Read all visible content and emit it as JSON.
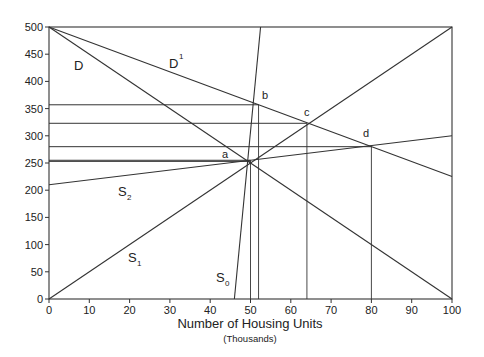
{
  "chart_data": {
    "type": "line",
    "title": "",
    "xlabel": "Number of Housing Units",
    "xlabel_sub": "(Thousands)",
    "ylabel": "",
    "xlim": [
      0,
      100
    ],
    "ylim": [
      0,
      500
    ],
    "x_ticks": [
      0,
      10,
      20,
      30,
      40,
      50,
      60,
      70,
      80,
      90,
      100
    ],
    "y_ticks": [
      0,
      50,
      100,
      150,
      200,
      250,
      300,
      350,
      400,
      450,
      500
    ],
    "grid": false,
    "series": [
      {
        "name": "D",
        "points": [
          [
            0,
            500
          ],
          [
            100,
            0
          ]
        ]
      },
      {
        "name": "D1",
        "points": [
          [
            0,
            500
          ],
          [
            100,
            225
          ]
        ]
      },
      {
        "name": "S0",
        "points": [
          [
            46,
            0
          ],
          [
            52.5,
            500
          ]
        ]
      },
      {
        "name": "S1",
        "points": [
          [
            0,
            0
          ],
          [
            100,
            500
          ]
        ]
      },
      {
        "name": "S2",
        "points": [
          [
            0,
            210
          ],
          [
            100,
            300
          ]
        ]
      }
    ],
    "annotations": [
      {
        "label": "a",
        "x": 50,
        "y": 255
      },
      {
        "label": "b",
        "x": 52,
        "y": 357
      },
      {
        "label": "c",
        "x": 64,
        "y": 323
      },
      {
        "label": "d",
        "x": 80,
        "y": 280
      }
    ],
    "reference_lines": {
      "horizontal": [
        357,
        323,
        280,
        255,
        253
      ],
      "vertical": [
        50,
        52,
        64,
        80
      ]
    },
    "curve_labels": [
      {
        "text": "D",
        "x": 7,
        "y": 415
      },
      {
        "text": "D",
        "sup": "1",
        "x": 31,
        "y": 420
      },
      {
        "text": "S",
        "sub": "2",
        "x": 13,
        "y": 190
      },
      {
        "text": "S",
        "sub": "1",
        "x": 20,
        "y": 80
      },
      {
        "text": "S",
        "sub": "0",
        "x": 42,
        "y": 35
      }
    ]
  },
  "labels": {
    "D": "D",
    "D1": "D",
    "D1_sup": "1",
    "S": "S",
    "S0_sub": "0",
    "S1_sub": "1",
    "S2_sub": "2",
    "a": "a",
    "b": "b",
    "c": "c",
    "d": "d",
    "xlabel": "Number of Housing Units",
    "xlabel_sub": "(Thousands)"
  }
}
